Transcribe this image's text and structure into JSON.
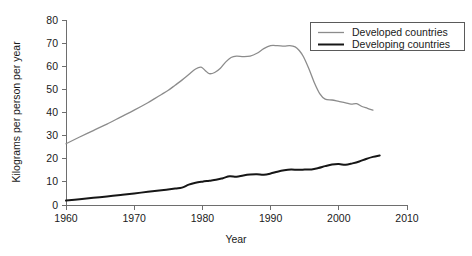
{
  "chart_data": {
    "type": "line",
    "title": "",
    "xlabel": "Year",
    "ylabel": "Kilograms per person per year",
    "xlim": [
      1960,
      2010
    ],
    "ylim": [
      0,
      80
    ],
    "xticks": [
      1960,
      1970,
      1980,
      1990,
      2000,
      2010
    ],
    "xtick_labels": [
      "1960",
      "1970",
      "1980",
      "1990",
      "2000",
      "2010"
    ],
    "yticks": [
      0,
      10,
      20,
      30,
      40,
      50,
      60,
      70,
      80
    ],
    "ytick_labels": [
      "0",
      "10",
      "20",
      "30",
      "40",
      "50",
      "60",
      "70",
      "80"
    ],
    "grid": false,
    "legend_position": "top-right",
    "colors": {
      "developed": "#8c8c8c",
      "developing": "#161616",
      "axis": "#6e6e6e",
      "text": "#1a1a1a",
      "background": "#ffffff"
    },
    "series": [
      {
        "name": "Developed countries",
        "color": "#8c8c8c",
        "x": [
          1960,
          1961,
          1962,
          1963,
          1964,
          1965,
          1966,
          1967,
          1968,
          1969,
          1970,
          1971,
          1972,
          1973,
          1974,
          1975,
          1976,
          1977,
          1978,
          1979,
          1980,
          1981,
          1982,
          1983,
          1984,
          1985,
          1986,
          1987,
          1988,
          1989,
          1990,
          1991,
          1992,
          1993,
          1994,
          1995,
          1996,
          1997,
          1998,
          1999,
          2000,
          2001,
          2002,
          2003,
          2004,
          2005
        ],
        "values": [
          26.5,
          27.5,
          28.8,
          30.2,
          31.6,
          33.0,
          34.4,
          35.9,
          37.4,
          39.0,
          40.6,
          42.2,
          43.9,
          45.6,
          47.4,
          49.2,
          51.0,
          52.9,
          54.8,
          57.0,
          59.4,
          57.2,
          58.0,
          60.8,
          63.6,
          64.4,
          64.4,
          64.6,
          65.6,
          67.6,
          68.8,
          68.6,
          68.4,
          68.5,
          67.6,
          64.0,
          66.4,
          68.0,
          68.6,
          68.6,
          68.3,
          67.8,
          64.2,
          58.0,
          51.6,
          47.0
        ],
        "values_note": "continues after 2005 index in x2/values2"
      },
      {
        "name": "Developing countries",
        "color": "#161616",
        "x": [
          1960,
          1961,
          1962,
          1963,
          1964,
          1965,
          1966,
          1967,
          1968,
          1969,
          1970,
          1971,
          1972,
          1973,
          1974,
          1975,
          1976,
          1977,
          1978,
          1979,
          1980,
          1981,
          1982,
          1983,
          1984,
          1985,
          1986,
          1987,
          1988,
          1989,
          1990,
          1991,
          1992,
          1993,
          1994,
          1995,
          1996,
          1997,
          1998,
          1999,
          2000,
          2001,
          2002,
          2003,
          2004,
          2005
        ],
        "values": [
          1.9,
          2.2,
          2.5,
          2.8,
          3.1,
          3.4,
          3.7,
          4.0,
          4.4,
          4.8,
          5.2,
          5.5,
          5.9,
          6.2,
          6.6,
          7.0,
          7.3,
          7.7,
          8.7,
          9.6,
          10.2,
          10.6,
          11.0,
          11.6,
          12.3,
          12.2,
          12.7,
          13.1,
          13.3,
          13.2,
          13.7,
          14.4,
          15.0,
          15.3,
          15.2,
          15.4,
          15.4,
          15.9,
          16.7,
          17.4,
          17.6,
          17.4,
          17.9,
          18.6,
          19.6,
          20.5
        ]
      }
    ],
    "developed_full": {
      "x": [
        1960,
        1961,
        1962,
        1963,
        1964,
        1965,
        1966,
        1967,
        1968,
        1969,
        1970,
        1971,
        1972,
        1973,
        1974,
        1975,
        1976,
        1977,
        1978,
        1979,
        1980,
        1981,
        1982,
        1983,
        1984,
        1985,
        1986,
        1987,
        1988,
        1989,
        1990,
        1991,
        1992,
        1993,
        1994,
        1995,
        1996,
        1997,
        1998,
        1999,
        2000,
        2001,
        2002,
        2003,
        2004,
        2005
      ],
      "values": [
        26.5,
        27.8,
        29.2,
        30.6,
        32.0,
        33.4,
        34.9,
        36.4,
        37.9,
        39.5,
        41.1,
        42.8,
        44.5,
        46.3,
        48.2,
        50.2,
        52.4,
        54.7,
        57.2,
        59.6,
        57.0,
        58.4,
        61.6,
        64.0,
        64.6,
        64.3,
        64.2,
        64.6,
        66.0,
        67.8,
        68.9,
        68.8,
        68.7,
        68.8,
        68.0,
        64.6,
        60.0,
        54.0,
        48.2,
        45.4,
        45.1,
        44.2,
        43.8,
        44.0,
        43.2,
        42.4
      ]
    },
    "developed_tail": {
      "x": [
        1995,
        1996,
        1997,
        1998,
        1999,
        2000,
        2001,
        2002,
        2003,
        2004,
        2005
      ],
      "values": [
        64.6,
        58.0,
        50.0,
        46.0,
        45.2,
        44.6,
        44.0,
        43.6,
        43.8,
        42.0,
        41.0
      ]
    },
    "legend": {
      "entries": [
        {
          "label": "Developed countries",
          "color": "#8c8c8c",
          "width": 1.3
        },
        {
          "label": "Developing countries",
          "color": "#161616",
          "width": 2.0
        }
      ]
    }
  },
  "developed_points": [
    [
      1960,
      26.5
    ],
    [
      1962,
      29.4
    ],
    [
      1964,
      32.2
    ],
    [
      1966,
      35.0
    ],
    [
      1968,
      38.0
    ],
    [
      1970,
      41.0
    ],
    [
      1972,
      44.2
    ],
    [
      1973,
      46.0
    ],
    [
      1974,
      47.8
    ],
    [
      1975,
      49.6
    ],
    [
      1976,
      51.8
    ],
    [
      1977,
      54.0
    ],
    [
      1978,
      56.4
    ],
    [
      1979,
      58.8
    ],
    [
      1979.8,
      59.6
    ],
    [
      1980.4,
      58.2
    ],
    [
      1981,
      56.8
    ],
    [
      1981.8,
      57.3
    ],
    [
      1982.6,
      59.0
    ],
    [
      1983.4,
      61.8
    ],
    [
      1984.2,
      63.8
    ],
    [
      1985,
      64.4
    ],
    [
      1986,
      64.2
    ],
    [
      1987,
      64.4
    ],
    [
      1988,
      65.6
    ],
    [
      1989,
      67.6
    ],
    [
      1990,
      68.9
    ],
    [
      1991,
      68.9
    ],
    [
      1992,
      68.7
    ],
    [
      1992.8,
      68.9
    ],
    [
      1993.6,
      68.4
    ],
    [
      1994.2,
      66.8
    ],
    [
      1994.8,
      64.2
    ],
    [
      1995.6,
      59.0
    ],
    [
      1996.4,
      53.0
    ],
    [
      1997.2,
      48.2
    ],
    [
      1998,
      45.8
    ],
    [
      1999,
      45.4
    ],
    [
      2000,
      44.8
    ],
    [
      2001,
      44.2
    ],
    [
      2001.8,
      43.6
    ],
    [
      2002.6,
      43.8
    ],
    [
      2003.4,
      42.6
    ],
    [
      2004.2,
      41.8
    ],
    [
      2005,
      41.0
    ]
  ],
  "developing_points": [
    [
      1960,
      1.9
    ],
    [
      1962,
      2.5
    ],
    [
      1964,
      3.1
    ],
    [
      1966,
      3.7
    ],
    [
      1968,
      4.3
    ],
    [
      1970,
      5.0
    ],
    [
      1972,
      5.7
    ],
    [
      1974,
      6.4
    ],
    [
      1976,
      7.1
    ],
    [
      1977,
      7.5
    ],
    [
      1978,
      8.8
    ],
    [
      1979,
      9.6
    ],
    [
      1980,
      10.1
    ],
    [
      1981,
      10.5
    ],
    [
      1982,
      10.9
    ],
    [
      1983,
      11.6
    ],
    [
      1984,
      12.4
    ],
    [
      1985,
      12.2
    ],
    [
      1986,
      12.8
    ],
    [
      1987,
      13.2
    ],
    [
      1988,
      13.3
    ],
    [
      1989,
      13.1
    ],
    [
      1990,
      13.6
    ],
    [
      1991,
      14.4
    ],
    [
      1992,
      15.0
    ],
    [
      1993,
      15.3
    ],
    [
      1994,
      15.2
    ],
    [
      1995,
      15.3
    ],
    [
      1996,
      15.4
    ],
    [
      1997,
      16.0
    ],
    [
      1998,
      16.8
    ],
    [
      1999,
      17.5
    ],
    [
      2000,
      17.7
    ],
    [
      2001,
      17.4
    ],
    [
      2002,
      18.0
    ],
    [
      2003,
      18.8
    ],
    [
      2004,
      19.9
    ],
    [
      2005,
      20.8
    ],
    [
      2006,
      21.4
    ]
  ]
}
